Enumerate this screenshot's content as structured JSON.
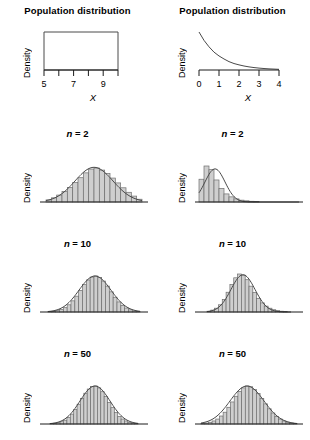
{
  "figure": {
    "columns": [
      {
        "id": "uniform",
        "population": "uniform"
      },
      {
        "id": "exponential",
        "population": "exponential"
      }
    ]
  },
  "labels": {
    "population_title": "Population distribution",
    "y_axis": "Density",
    "x_axis": "X",
    "n2": "n = 2",
    "n10": "n = 10",
    "n50": "n = 50",
    "n_symbol": "n",
    "n2_value": "= 2",
    "n10_value": "= 10",
    "n50_value": "= 50"
  },
  "colors": {
    "bar_fill": "#cfcfcf",
    "bar_stroke": "#6e6e6e",
    "curve": "#4a4a4a",
    "axis": "#1a1a1a",
    "text": "#000000",
    "background": "#ffffff"
  },
  "chart_data": [
    {
      "id": "pop-uniform",
      "type": "line",
      "title": "Population distribution",
      "xlabel": "X",
      "ylabel": "Density",
      "xlim": [
        4.5,
        10.5
      ],
      "ylim": [
        0,
        0.25
      ],
      "xticks": [
        5,
        6,
        7,
        8,
        9,
        10
      ],
      "xtick_labels": [
        "5",
        "",
        "7",
        "",
        "9",
        ""
      ],
      "grid": false,
      "legend": "none",
      "shape": "uniform-rectangle",
      "x": [
        5,
        10
      ],
      "values": [
        0.2,
        0.2
      ],
      "note": "Uniform(5,10) density drawn as a rectangle"
    },
    {
      "id": "pop-exponential",
      "type": "line",
      "title": "Population distribution",
      "xlabel": "X",
      "ylabel": "Density",
      "xlim": [
        0,
        4
      ],
      "ylim": [
        0,
        1.0
      ],
      "xticks": [
        0,
        1,
        2,
        3,
        4
      ],
      "xtick_labels": [
        "0",
        "1",
        "2",
        "3",
        "4"
      ],
      "grid": false,
      "legend": "none",
      "shape": "exponential-decay",
      "x": [
        0,
        0.25,
        0.5,
        0.75,
        1,
        1.25,
        1.5,
        1.75,
        2,
        2.25,
        2.5,
        2.75,
        3,
        3.25,
        3.5,
        3.75,
        4
      ],
      "values": [
        1.0,
        0.78,
        0.61,
        0.47,
        0.37,
        0.29,
        0.22,
        0.17,
        0.135,
        0.105,
        0.082,
        0.064,
        0.05,
        0.039,
        0.03,
        0.024,
        0.018
      ],
      "note": "Exponential(rate=1) density"
    },
    {
      "id": "uniform-n2",
      "type": "bar",
      "title": "n = 2",
      "xlabel": "",
      "ylabel": "Density",
      "sample_size": 2,
      "grid": false,
      "legend": "none",
      "categories": [
        "b1",
        "b2",
        "b3",
        "b4",
        "b5",
        "b6",
        "b7",
        "b8",
        "b9",
        "b10",
        "b11",
        "b12",
        "b13",
        "b14",
        "b15",
        "b16",
        "b17",
        "b18"
      ],
      "values": [
        0.06,
        0.12,
        0.2,
        0.3,
        0.42,
        0.56,
        0.7,
        0.84,
        0.95,
        0.98,
        0.92,
        0.82,
        0.69,
        0.55,
        0.41,
        0.28,
        0.17,
        0.08
      ],
      "overlay_curve": "normal",
      "note": "Triangular sampling distribution of the mean of 2 uniform draws"
    },
    {
      "id": "exponential-n2",
      "type": "bar",
      "title": "n = 2",
      "xlabel": "",
      "ylabel": "Density",
      "sample_size": 2,
      "grid": false,
      "legend": "none",
      "categories": [
        "b1",
        "b2",
        "b3",
        "b4",
        "b5",
        "b6",
        "b7",
        "b8",
        "b9",
        "b10",
        "b11",
        "b12",
        "b13",
        "b14",
        "b15",
        "b16",
        "b17",
        "b18",
        "b19",
        "b20"
      ],
      "values": [
        0.62,
        0.98,
        0.88,
        0.6,
        0.37,
        0.22,
        0.14,
        0.085,
        0.05,
        0.032,
        0.02,
        0.013,
        0.009,
        0.006,
        0.004,
        0.003,
        0.002,
        0.0015,
        0.001,
        0.0008
      ],
      "overlay_curve": "normal",
      "note": "Right-skewed sampling distribution of the mean of 2 exponential draws"
    },
    {
      "id": "uniform-n10",
      "type": "bar",
      "title": "n = 10",
      "xlabel": "",
      "ylabel": "Density",
      "sample_size": 10,
      "grid": false,
      "legend": "none",
      "categories": [
        "b1",
        "b2",
        "b3",
        "b4",
        "b5",
        "b6",
        "b7",
        "b8",
        "b9",
        "b10",
        "b11",
        "b12",
        "b13",
        "b14",
        "b15",
        "b16",
        "b17",
        "b18",
        "b19",
        "b20",
        "b21",
        "b22",
        "b23",
        "b24"
      ],
      "values": [
        0.01,
        0.02,
        0.04,
        0.07,
        0.12,
        0.2,
        0.31,
        0.44,
        0.6,
        0.76,
        0.89,
        0.97,
        1.0,
        0.96,
        0.86,
        0.72,
        0.56,
        0.41,
        0.28,
        0.18,
        0.11,
        0.06,
        0.03,
        0.015
      ],
      "overlay_curve": "normal",
      "note": "Approximately normal, narrower than n=2"
    },
    {
      "id": "exponential-n10",
      "type": "bar",
      "title": "n = 10",
      "xlabel": "",
      "ylabel": "Density",
      "sample_size": 10,
      "grid": false,
      "legend": "none",
      "categories": [
        "b1",
        "b2",
        "b3",
        "b4",
        "b5",
        "b6",
        "b7",
        "b8",
        "b9",
        "b10",
        "b11",
        "b12",
        "b13",
        "b14",
        "b15",
        "b16",
        "b17",
        "b18",
        "b19",
        "b20",
        "b21",
        "b22"
      ],
      "values": [
        0.02,
        0.05,
        0.1,
        0.19,
        0.33,
        0.52,
        0.72,
        0.9,
        1.0,
        0.97,
        0.85,
        0.68,
        0.51,
        0.36,
        0.24,
        0.155,
        0.1,
        0.06,
        0.036,
        0.021,
        0.012,
        0.007
      ],
      "overlay_curve": "normal",
      "note": "Nearly normal with slight right skew"
    },
    {
      "id": "uniform-n50",
      "type": "bar",
      "title": "n = 50",
      "xlabel": "",
      "ylabel": "Density",
      "sample_size": 50,
      "grid": false,
      "legend": "none",
      "categories": [
        "b1",
        "b2",
        "b3",
        "b4",
        "b5",
        "b6",
        "b7",
        "b8",
        "b9",
        "b10",
        "b11",
        "b12",
        "b13",
        "b14",
        "b15",
        "b16",
        "b17",
        "b18",
        "b19",
        "b20",
        "b21",
        "b22",
        "b23",
        "b24",
        "b25",
        "b26"
      ],
      "values": [
        0.01,
        0.02,
        0.035,
        0.06,
        0.1,
        0.17,
        0.26,
        0.38,
        0.52,
        0.67,
        0.81,
        0.92,
        0.99,
        1.0,
        0.95,
        0.85,
        0.72,
        0.57,
        0.43,
        0.3,
        0.2,
        0.13,
        0.08,
        0.045,
        0.025,
        0.012
      ],
      "overlay_curve": "normal",
      "note": "Normal, narrow"
    },
    {
      "id": "exponential-n50",
      "type": "bar",
      "title": "n = 50",
      "xlabel": "",
      "ylabel": "Density",
      "sample_size": 50,
      "grid": false,
      "legend": "none",
      "categories": [
        "b1",
        "b2",
        "b3",
        "b4",
        "b5",
        "b6",
        "b7",
        "b8",
        "b9",
        "b10",
        "b11",
        "b12",
        "b13",
        "b14",
        "b15",
        "b16",
        "b17",
        "b18",
        "b19",
        "b20",
        "b21",
        "b22",
        "b23",
        "b24",
        "b25",
        "b26"
      ],
      "values": [
        0.012,
        0.025,
        0.045,
        0.08,
        0.13,
        0.21,
        0.31,
        0.44,
        0.58,
        0.73,
        0.86,
        0.95,
        1.0,
        0.98,
        0.91,
        0.8,
        0.67,
        0.53,
        0.4,
        0.29,
        0.2,
        0.13,
        0.08,
        0.048,
        0.027,
        0.014
      ],
      "overlay_curve": "normal",
      "note": "Normal, essentially symmetric"
    }
  ]
}
